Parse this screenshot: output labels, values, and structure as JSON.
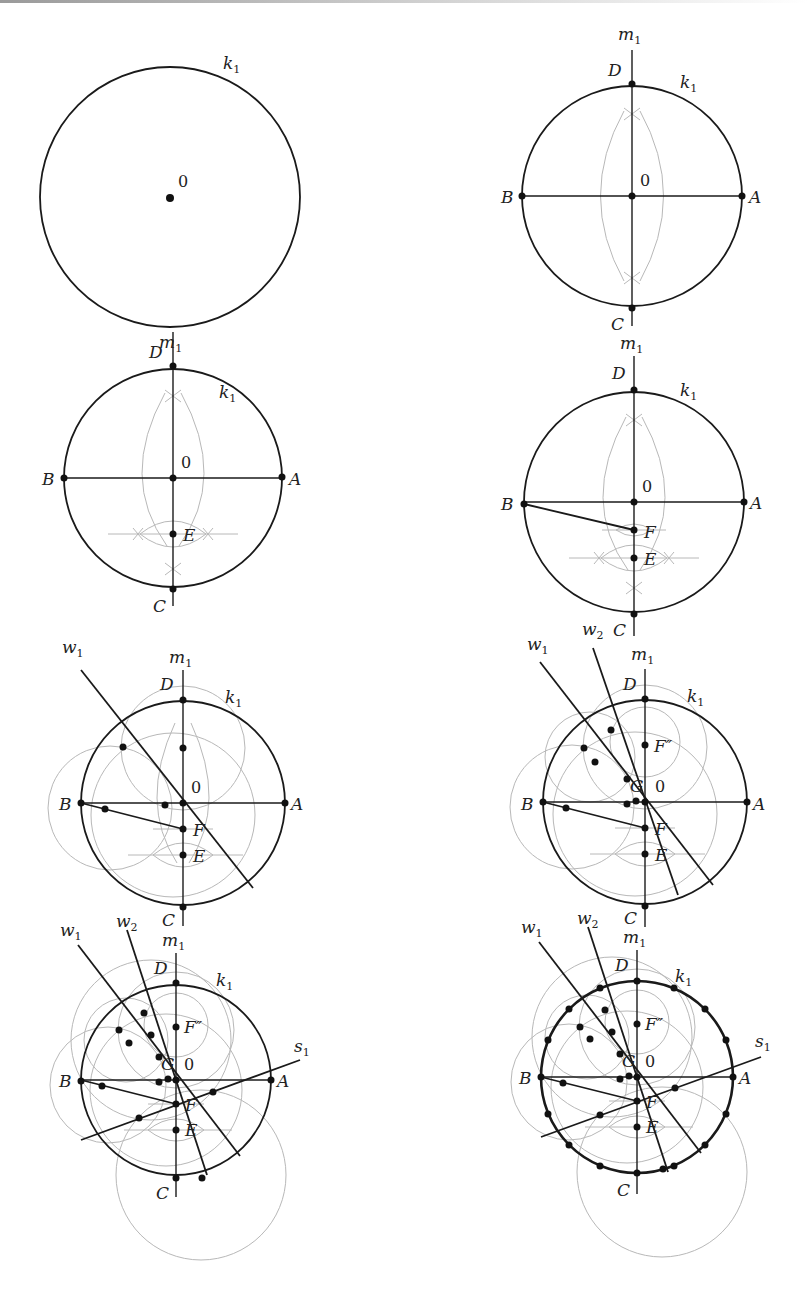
{
  "figure": {
    "panels": [
      {
        "step": 1,
        "labels": {
          "circle": "k",
          "circle_sub": "1",
          "center": "0"
        }
      },
      {
        "step": 2,
        "labels": {
          "axis": "m",
          "axis_sub": "1",
          "circle": "k",
          "circle_sub": "1",
          "center": "0",
          "points": [
            "A",
            "B",
            "C",
            "D"
          ]
        }
      },
      {
        "step": 3,
        "labels": {
          "axis": "m",
          "axis_sub": "1",
          "circle": "k",
          "circle_sub": "1",
          "center": "0",
          "points": [
            "A",
            "B",
            "C",
            "D",
            "E"
          ]
        }
      },
      {
        "step": 4,
        "labels": {
          "axis": "m",
          "axis_sub": "1",
          "circle": "k",
          "circle_sub": "1",
          "center": "0",
          "points": [
            "A",
            "B",
            "C",
            "D",
            "E",
            "F"
          ]
        }
      },
      {
        "step": 5,
        "labels": {
          "axis": "m",
          "axis_sub": "1",
          "circle": "k",
          "circle_sub": "1",
          "center": "0",
          "lines": [
            "w1"
          ],
          "points": [
            "A",
            "B",
            "C",
            "D",
            "E",
            "F"
          ]
        }
      },
      {
        "step": 6,
        "labels": {
          "axis": "m",
          "axis_sub": "1",
          "circle": "k",
          "circle_sub": "1",
          "center": "0",
          "lines": [
            "w1",
            "w2"
          ],
          "points": [
            "A",
            "B",
            "C",
            "D",
            "E",
            "F",
            "F''",
            "G"
          ]
        }
      },
      {
        "step": 7,
        "labels": {
          "axis": "m",
          "axis_sub": "1",
          "circle": "k",
          "circle_sub": "1",
          "center": "0",
          "lines": [
            "w1",
            "w2",
            "s1"
          ],
          "points": [
            "A",
            "B",
            "C",
            "D",
            "E",
            "F",
            "F''",
            "G"
          ]
        }
      },
      {
        "step": 8,
        "labels": {
          "axis": "m",
          "axis_sub": "1",
          "circle": "k",
          "circle_sub": "1",
          "center": "0",
          "lines": [
            "w1",
            "w2",
            "s1"
          ],
          "points": [
            "A",
            "B",
            "C",
            "D",
            "E",
            "F",
            "F''",
            "G"
          ],
          "division_points_on_k1": 20
        }
      }
    ]
  },
  "text": {
    "k": "k",
    "sub1": "1",
    "sub2": "2",
    "m": "m",
    "w": "w",
    "s": "s",
    "zero": "0",
    "A": "A",
    "B": "B",
    "C": "C",
    "D": "D",
    "E": "E",
    "F": "F",
    "F2": "F″",
    "G": "G"
  },
  "colors": {
    "main_stroke": "#1a1a1a",
    "aux_stroke": "#b8b8b8",
    "background": "#ffffff"
  }
}
